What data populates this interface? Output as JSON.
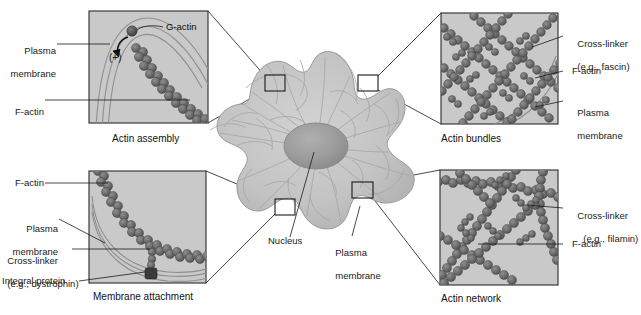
{
  "figure": {
    "type": "cell-biology-diagram",
    "background_color": "#ffffff",
    "colors": {
      "panel_background": "#c9c9c9",
      "filament": "#6d6d6d",
      "filament_dark": "#555555",
      "cell_body": "#c2c2c2",
      "nucleus": "#9e9e9e",
      "membrane_line": "#8d8d8d",
      "callout_line": "#1a1a1a",
      "text": "#1a1a1a"
    }
  },
  "center": {
    "name": "cell",
    "labels": {
      "nucleus": "Nucleus",
      "plasma_membrane": "Plasma\nmembrane"
    }
  },
  "panels": [
    {
      "id": "actin-assembly",
      "caption": "Actin assembly",
      "position": "top-left",
      "labels": [
        {
          "text": "Plasma\nmembrane",
          "side": "left"
        },
        {
          "text": "F-actin",
          "side": "left"
        },
        {
          "text": "G-actin",
          "side": "inside"
        },
        {
          "text": "(+)",
          "side": "inside"
        }
      ]
    },
    {
      "id": "actin-bundles",
      "caption": "Actin bundles",
      "position": "top-right",
      "labels": [
        {
          "text": "Cross-linker\n(e.g., fascin)",
          "side": "right"
        },
        {
          "text": "F-actin",
          "side": "right"
        },
        {
          "text": "Plasma\nmembrane",
          "side": "right"
        }
      ]
    },
    {
      "id": "membrane-attachment",
      "caption": "Membrane attachment",
      "position": "bottom-left",
      "labels": [
        {
          "text": "F-actin",
          "side": "left"
        },
        {
          "text": "Plasma\nmembrane",
          "side": "left"
        },
        {
          "text": "Cross-linker\n(e.g., dystrophin)",
          "side": "left"
        },
        {
          "text": "Integral protein",
          "side": "left"
        }
      ]
    },
    {
      "id": "actin-network",
      "caption": "Actin network",
      "position": "bottom-right",
      "labels": [
        {
          "text": "Cross-linker\n(e.g., filamin)",
          "side": "right"
        },
        {
          "text": "F-actin",
          "side": "right"
        }
      ]
    }
  ],
  "label_text": {
    "tl_plasma_1": "Plasma",
    "tl_plasma_2": "membrane",
    "tl_factin": "F-actin",
    "tl_gactin": "G-actin",
    "tl_plus": "(+)",
    "tl_caption": "Actin assembly",
    "tr_cross_1": "Cross-linker",
    "tr_cross_2": "(e.g., fascin)",
    "tr_factin": "F-actin",
    "tr_plasma_1": "Plasma",
    "tr_plasma_2": "membrane",
    "tr_caption": "Actin bundles",
    "bl_factin": "F-actin",
    "bl_plasma_1": "Plasma",
    "bl_plasma_2": "membrane",
    "bl_cross_1": "Cross-linker",
    "bl_cross_2": "(e.g., dystrophin)",
    "bl_integral": "Integral protein",
    "bl_caption": "Membrane attachment",
    "br_cross_1": "Cross-linker",
    "br_cross_2": "(e.g., filamin)",
    "br_factin": "F-actin",
    "br_caption": "Actin network",
    "c_nucleus": "Nucleus",
    "c_plasma_1": "Plasma",
    "c_plasma_2": "membrane"
  }
}
